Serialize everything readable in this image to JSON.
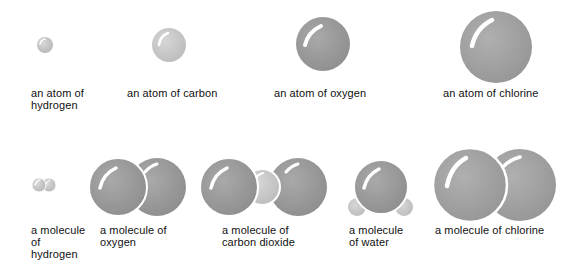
{
  "atoms": [
    {
      "label": "an atom of\nhydrogen",
      "element": "hydrogen",
      "x": 31,
      "y": 87
    },
    {
      "label": "an atom of carbon",
      "element": "carbon",
      "x": 127,
      "y": 87
    },
    {
      "label": "an atom of oxygen",
      "element": "oxygen",
      "x": 274,
      "y": 87
    },
    {
      "label": "an atom of chlorine",
      "element": "chlorine",
      "x": 443,
      "y": 87
    }
  ],
  "molecules": [
    {
      "label": "a molecule\nof\nhydrogen",
      "formula": "H2",
      "x": 31,
      "y": 224
    },
    {
      "label": "a molecule of\noxygen",
      "formula": "O2",
      "x": 100,
      "y": 224
    },
    {
      "label": "a molecule of\ncarbon dioxide",
      "formula": "CO2",
      "x": 222,
      "y": 224
    },
    {
      "label": "a molecule\nof water",
      "formula": "H2O",
      "x": 349,
      "y": 224
    },
    {
      "label": "a molecule of chlorine",
      "formula": "Cl2",
      "x": 435,
      "y": 224
    }
  ],
  "colors": {
    "hydrogen": "#c4c4c4",
    "carbon": "#c9c9c9",
    "oxygen": "#9c9c9c",
    "chlorine": "#a4a4a4",
    "outline": "#ffffff",
    "highlight": "#ffffff"
  }
}
